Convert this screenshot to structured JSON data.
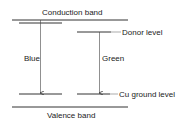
{
  "diagram": {
    "conduction_band_label": "Conduction band",
    "valence_band_label": "Valence band",
    "donor_level_label": "Donor level",
    "cu_ground_level_label": "Cu ground level",
    "transitions": [
      {
        "label": "Blue"
      },
      {
        "label": "Green"
      }
    ],
    "colors": {
      "line": "#333333",
      "text": "#222222",
      "background": "#ffffff"
    }
  }
}
